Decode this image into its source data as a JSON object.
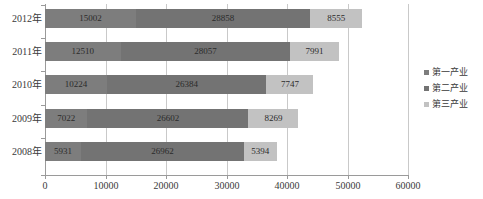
{
  "chart_data": {
    "type": "bar",
    "orientation": "horizontal",
    "stacked": true,
    "title": "",
    "xlabel": "",
    "ylabel": "",
    "xlim": [
      0,
      60000
    ],
    "xticks": [
      0,
      10000,
      20000,
      30000,
      40000,
      50000,
      60000
    ],
    "xtick_labels": [
      "0",
      "10000",
      "20000",
      "30000",
      "40000",
      "50000",
      "60000"
    ],
    "grid": true,
    "grid_axis": "x",
    "legend_position": "right",
    "categories": [
      "2012年",
      "2011年",
      "2010年",
      "2009年",
      "2008年"
    ],
    "series": [
      {
        "name": "第一产业",
        "color": "#7d7d7d",
        "values": [
          15002,
          12510,
          10224,
          7022,
          5931
        ]
      },
      {
        "name": "第二产业",
        "color": "#737373",
        "values": [
          28858,
          28057,
          26384,
          26602,
          26962
        ]
      },
      {
        "name": "第三产业",
        "color": "#c2c2c2",
        "values": [
          8555,
          7991,
          7747,
          8269,
          5394
        ]
      }
    ],
    "totals": [
      52415,
      48558,
      44355,
      41893,
      38287
    ],
    "data_labels": [
      [
        "15002",
        "28858",
        "8555"
      ],
      [
        "12510",
        "28057",
        "7991"
      ],
      [
        "10224",
        "26384",
        "7747"
      ],
      [
        "7022",
        "26602",
        "8269"
      ],
      [
        "5931",
        "26962",
        "5394"
      ]
    ]
  },
  "legend": {
    "items": [
      {
        "label": "第一产业",
        "color": "#7d7d7d"
      },
      {
        "label": "第二产业",
        "color": "#737373"
      },
      {
        "label": "第三产业",
        "color": "#c2c2c2"
      }
    ]
  },
  "axis": {
    "x_labels": [
      "0",
      "10000",
      "20000",
      "30000",
      "40000",
      "50000",
      "60000"
    ],
    "y_labels": [
      "2012年",
      "2011年",
      "2010年",
      "2009年",
      "2008年"
    ]
  }
}
